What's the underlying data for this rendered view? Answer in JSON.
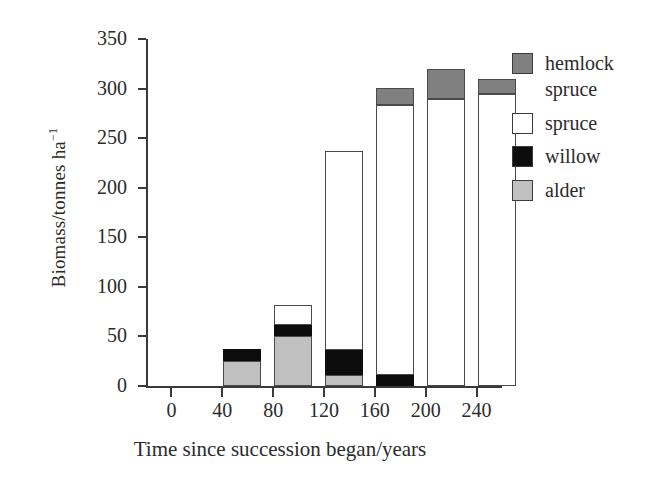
{
  "chart_data": {
    "type": "bar",
    "subtype": "stacked-bar",
    "title": "",
    "xlabel": "Time since succession began/years",
    "ylabel": "Biomass/tonnes ha−1",
    "ylabel_base": "Biomass/tonnes ha",
    "ylabel_exponent": "−1",
    "categories": [
      "0",
      "40",
      "80",
      "120",
      "160",
      "200",
      "240"
    ],
    "xticks": [
      0,
      40,
      80,
      120,
      160,
      200,
      240
    ],
    "yticks": [
      0,
      50,
      100,
      150,
      200,
      250,
      300,
      350
    ],
    "ytick_labels": [
      "0",
      "50",
      "100",
      "150",
      "200",
      "250",
      "300",
      "350"
    ],
    "ylim": [
      0,
      350
    ],
    "xlim": [
      -20,
      260
    ],
    "grid": false,
    "legend_position": "right",
    "series": [
      {
        "name": "hemlock spruce",
        "color": "#808080",
        "values": [
          0,
          0,
          0,
          0,
          18,
          30,
          15
        ]
      },
      {
        "name": "spruce",
        "color": "#ffffff",
        "values": [
          0,
          0,
          20,
          201,
          272,
          290,
          295
        ]
      },
      {
        "name": "willow",
        "color": "#0d0d0d",
        "values": [
          0,
          12,
          12,
          25,
          11,
          0,
          0
        ]
      },
      {
        "name": "alder",
        "color": "#c0c0c0",
        "values": [
          0,
          25,
          50,
          11,
          0,
          0,
          0
        ]
      }
    ],
    "totals": [
      0,
      37,
      82,
      237,
      301,
      320,
      310
    ],
    "bars": [
      {
        "category": "0",
        "total": 0,
        "stack": []
      },
      {
        "category": "40",
        "total": 37,
        "stack": [
          {
            "name": "alder",
            "from": 0,
            "to": 25
          },
          {
            "name": "willow",
            "from": 25,
            "to": 37
          }
        ]
      },
      {
        "category": "80",
        "total": 82,
        "stack": [
          {
            "name": "alder",
            "from": 0,
            "to": 50
          },
          {
            "name": "willow",
            "from": 50,
            "to": 62
          },
          {
            "name": "spruce",
            "from": 62,
            "to": 82
          }
        ]
      },
      {
        "category": "120",
        "total": 237,
        "stack": [
          {
            "name": "alder",
            "from": 0,
            "to": 11
          },
          {
            "name": "willow",
            "from": 11,
            "to": 36
          },
          {
            "name": "spruce",
            "from": 36,
            "to": 237
          }
        ]
      },
      {
        "category": "160",
        "total": 301,
        "stack": [
          {
            "name": "willow",
            "from": 0,
            "to": 11
          },
          {
            "name": "spruce",
            "from": 11,
            "to": 283
          },
          {
            "name": "hemlock spruce",
            "from": 283,
            "to": 301
          }
        ]
      },
      {
        "category": "200",
        "total": 320,
        "stack": [
          {
            "name": "spruce",
            "from": 0,
            "to": 290
          },
          {
            "name": "hemlock spruce",
            "from": 290,
            "to": 320
          }
        ]
      },
      {
        "category": "240",
        "total": 310,
        "stack": [
          {
            "name": "spruce",
            "from": 0,
            "to": 295
          },
          {
            "name": "hemlock spruce",
            "from": 295,
            "to": 310
          }
        ]
      }
    ],
    "legend": [
      {
        "label": "hemlock spruce",
        "swatch": "hemlock",
        "color": "#808080"
      },
      {
        "label": "spruce",
        "swatch": "spruce",
        "color": "#ffffff"
      },
      {
        "label": "willow",
        "swatch": "willow",
        "color": "#0d0d0d"
      },
      {
        "label": "alder",
        "swatch": "alder",
        "color": "#c0c0c0"
      }
    ]
  }
}
